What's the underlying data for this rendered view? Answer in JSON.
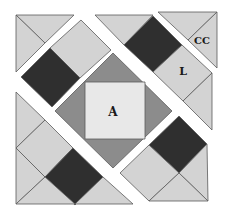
{
  "figure": {
    "title": "Quilt block diagram",
    "width": 227,
    "height": 216,
    "colors": {
      "background": "#ffffff",
      "dark": "#2f2f2f",
      "medium": "#8c8c8c",
      "light_square": "#e8e8e8",
      "light": "#d3d3d3",
      "outline": "#5a5a5a"
    },
    "labels": [
      {
        "text": "A",
        "x": 113,
        "y": 116,
        "size": 12,
        "name": "label-a"
      },
      {
        "text": "L",
        "x": 183,
        "y": 75,
        "size": 11,
        "name": "label-l"
      },
      {
        "text": "CC",
        "x": 202,
        "y": 44,
        "size": 10,
        "name": "label-cc"
      }
    ],
    "pieces": [
      {
        "name": "top-left-corner-triangle-a",
        "fill": "light",
        "points": "16,15 74,15 45,43"
      },
      {
        "name": "top-left-corner-triangle-b",
        "fill": "light",
        "points": "16,15 45,43 16,72"
      },
      {
        "name": "upper-left-band-light-square",
        "fill": "light",
        "points": "81,20 111,50 80,78 50,48"
      },
      {
        "name": "upper-left-band-dark-square",
        "fill": "dark",
        "points": "50,48 80,78 52,107 21,77"
      },
      {
        "name": "top-band-light-triangle",
        "fill": "light",
        "points": "95,15 153,15 124,45"
      },
      {
        "name": "top-band-dark-square",
        "fill": "dark",
        "points": "153,16 182,45 153,72 124,45"
      },
      {
        "name": "top-band-light-square-l",
        "fill": "light",
        "points": "182,45 212,73 183,101 153,72"
      },
      {
        "name": "top-band-right-triangle",
        "fill": "light",
        "points": "212,73 212,130 183,101"
      },
      {
        "name": "top-right-corner-triangle-a",
        "fill": "light",
        "points": "158,12 217,12 188,40"
      },
      {
        "name": "top-right-corner-triangle-cc",
        "fill": "light",
        "points": "217,12 217,68 188,40"
      },
      {
        "name": "center-diamond",
        "fill": "medium",
        "points": "113,53 172,111 113,168 55,111"
      },
      {
        "name": "center-square-a",
        "fill": "light_square",
        "points": "85,82 145,82 145,139 85,139"
      },
      {
        "name": "lower-left-band-top-triangle",
        "fill": "light",
        "points": "16,92 45,120 16,148"
      },
      {
        "name": "lower-left-band-light-square",
        "fill": "light",
        "points": "45,120 73,148 45,177 16,148"
      },
      {
        "name": "lower-left-band-dark-square",
        "fill": "dark",
        "points": "73,148 103,177 75,205 45,177"
      },
      {
        "name": "lower-left-band-left-triangle",
        "fill": "light",
        "points": "16,148 45,177 16,204"
      },
      {
        "name": "lower-left-band-bottom-triangle",
        "fill": "light",
        "points": "16,204 45,177 75,204"
      },
      {
        "name": "lower-left-band-right-triangle",
        "fill": "light",
        "points": "75,204 103,177 133,204"
      },
      {
        "name": "lower-right-band-dark-square",
        "fill": "dark",
        "points": "179,116 207,144 179,173 149,145"
      },
      {
        "name": "lower-right-band-light-square",
        "fill": "light",
        "points": "149,145 179,173 149,201 120,173"
      },
      {
        "name": "lower-right-band-right-triangle",
        "fill": "light",
        "points": "207,144 208,201 179,173"
      },
      {
        "name": "lower-right-band-bottom-triangle",
        "fill": "light",
        "points": "149,201 179,173 208,201"
      }
    ]
  }
}
